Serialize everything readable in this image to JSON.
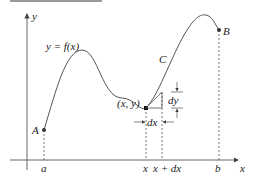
{
  "diagram": {
    "axes": {
      "x_label": "x",
      "y_label": "y"
    },
    "curve": {
      "equation_label": "y = f(x)",
      "name_label": "C",
      "start_point_label": "A",
      "end_point_label": "B",
      "point_label": "(x, y)"
    },
    "x_ticks": {
      "a": "a",
      "x": "x",
      "x_plus_dx": "x + dx",
      "b": "b"
    },
    "differentials": {
      "dx": "dx",
      "dy": "dy"
    },
    "colors": {
      "curve": "#555555",
      "axes": "#555555",
      "dashed": "#555555",
      "text": "#222222",
      "topbar": "#9a9a9a"
    }
  }
}
